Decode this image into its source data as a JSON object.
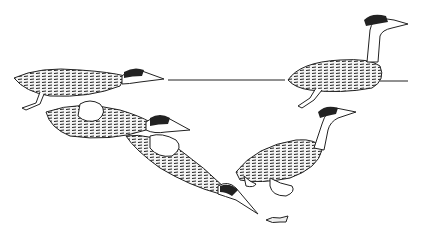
{
  "image": {
    "description": "Black-and-white line illustration of grebes diving underwater after a small fish",
    "background": "#ffffff",
    "ink": "#1a1a1a",
    "subjects": [
      "grebe-surface-left",
      "grebe-surface-right",
      "grebe-submerging",
      "grebe-diving",
      "grebe-swimming-underwater",
      "fish"
    ]
  }
}
